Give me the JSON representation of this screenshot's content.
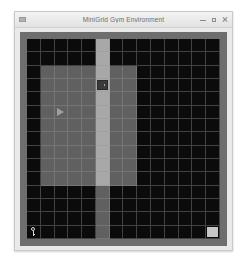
{
  "window": {
    "title": "MiniGrid Gym Environment",
    "menu_icon": "window-menu-icon",
    "controls": [
      {
        "name": "minimize-button",
        "glyph": "minimize-icon",
        "label": "–"
      },
      {
        "name": "maximize-button",
        "glyph": "maximize-icon",
        "label": "□"
      },
      {
        "name": "close-button",
        "glyph": "close-icon",
        "label": "×"
      }
    ]
  },
  "colors": {
    "window_background": "#e9e9e9",
    "titlebar": "#ecebec",
    "title_text": "#6c6c6c",
    "canvas_border": "#6e6e6e",
    "cell_empty": "#0b0b0b",
    "cell_room": "#606060",
    "cell_corridor": "#a8a8a8",
    "gridline": "#9a9a9a",
    "agent": "#9f9f9f",
    "key": "#d8d8d8",
    "goal": "#c6c6c6",
    "door": "#3a3a3a"
  },
  "grid": {
    "columns": 14,
    "rows": 15,
    "legend": {
      "empty": "unexplored-dark-cell",
      "room": "lit-room-floor",
      "corridor": "bright-corridor-floor"
    },
    "objects": [
      {
        "type": "agent",
        "name": "agent-triangle",
        "direction": "right",
        "col": 2,
        "row": 5
      },
      {
        "type": "door",
        "name": "door-object",
        "col": 5,
        "row": 3
      },
      {
        "type": "key",
        "name": "key-object",
        "col": 0,
        "row": 14
      },
      {
        "type": "goal",
        "name": "goal-tile",
        "col": 13,
        "row": 14
      }
    ],
    "tiles": [
      [
        "empty",
        "empty",
        "empty",
        "empty",
        "empty",
        "corridor",
        "empty",
        "empty",
        "empty",
        "empty",
        "empty",
        "empty",
        "empty",
        "empty"
      ],
      [
        "empty",
        "empty",
        "empty",
        "empty",
        "empty",
        "corridor",
        "empty",
        "empty",
        "empty",
        "empty",
        "empty",
        "empty",
        "empty",
        "empty"
      ],
      [
        "empty",
        "room",
        "room",
        "room",
        "room",
        "corridor",
        "room",
        "room",
        "empty",
        "empty",
        "empty",
        "empty",
        "empty",
        "empty"
      ],
      [
        "empty",
        "room",
        "room",
        "room",
        "room",
        "corridor",
        "room",
        "room",
        "empty",
        "empty",
        "empty",
        "empty",
        "empty",
        "empty"
      ],
      [
        "empty",
        "room",
        "room",
        "room",
        "room",
        "corridor",
        "room",
        "room",
        "empty",
        "empty",
        "empty",
        "empty",
        "empty",
        "empty"
      ],
      [
        "empty",
        "room",
        "room",
        "room",
        "room",
        "corridor",
        "room",
        "room",
        "empty",
        "empty",
        "empty",
        "empty",
        "empty",
        "empty"
      ],
      [
        "empty",
        "room",
        "room",
        "room",
        "room",
        "corridor",
        "room",
        "room",
        "empty",
        "empty",
        "empty",
        "empty",
        "empty",
        "empty"
      ],
      [
        "empty",
        "room",
        "room",
        "room",
        "room",
        "corridor",
        "room",
        "room",
        "empty",
        "empty",
        "empty",
        "empty",
        "empty",
        "empty"
      ],
      [
        "empty",
        "room",
        "room",
        "room",
        "room",
        "corridor",
        "room",
        "room",
        "empty",
        "empty",
        "empty",
        "empty",
        "empty",
        "empty"
      ],
      [
        "empty",
        "room",
        "room",
        "room",
        "room",
        "corridor",
        "room",
        "room",
        "empty",
        "empty",
        "empty",
        "empty",
        "empty",
        "empty"
      ],
      [
        "empty",
        "room",
        "room",
        "room",
        "room",
        "corridor",
        "room",
        "room",
        "empty",
        "empty",
        "empty",
        "empty",
        "empty",
        "empty"
      ],
      [
        "empty",
        "empty",
        "empty",
        "empty",
        "empty",
        "room",
        "empty",
        "empty",
        "empty",
        "empty",
        "empty",
        "empty",
        "empty",
        "empty"
      ],
      [
        "empty",
        "empty",
        "empty",
        "empty",
        "empty",
        "room",
        "empty",
        "empty",
        "empty",
        "empty",
        "empty",
        "empty",
        "empty",
        "empty"
      ],
      [
        "empty",
        "empty",
        "empty",
        "empty",
        "empty",
        "room",
        "empty",
        "empty",
        "empty",
        "empty",
        "empty",
        "empty",
        "empty",
        "empty"
      ],
      [
        "empty",
        "empty",
        "empty",
        "empty",
        "empty",
        "room",
        "empty",
        "empty",
        "empty",
        "empty",
        "empty",
        "empty",
        "empty",
        "goal"
      ]
    ]
  }
}
